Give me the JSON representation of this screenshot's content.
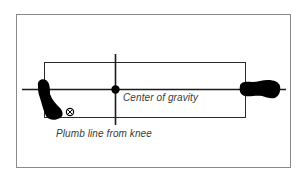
{
  "diagram": {
    "type": "footprint-stance-diagram",
    "labels": {
      "center_of_gravity": "Center of gravity",
      "plumb_line": "Plumb line from knee"
    },
    "markers": {
      "center_dot": "center-of-gravity-dot",
      "plumb_marker": "circled-x-marker"
    },
    "colors": {
      "line": "#1a1a1a",
      "frame": "#8a8a8a",
      "foot": "#000000",
      "text": "#3a3a3a",
      "background": "#ffffff"
    }
  }
}
